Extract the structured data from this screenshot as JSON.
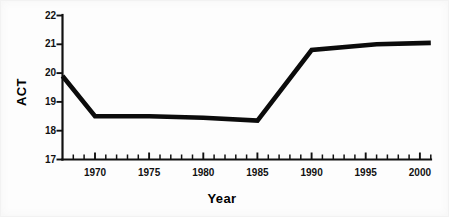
{
  "chart_data": {
    "type": "line",
    "title": "",
    "subtitle": "",
    "xlabel": "Year",
    "ylabel": "ACT",
    "xlim": [
      1967,
      2001
    ],
    "ylim": [
      17,
      22
    ],
    "grid": false,
    "legend": null,
    "x_ticks": [
      1970,
      1975,
      1980,
      1985,
      1990,
      1995,
      2000
    ],
    "x_tick_labels": [
      "1970",
      "1975",
      "1980",
      "1985",
      "1990",
      "1995",
      "2000"
    ],
    "x_minor_tick_step": 1,
    "y_ticks": [
      17,
      18,
      19,
      20,
      21,
      22
    ],
    "y_tick_labels": [
      "17",
      "18",
      "19",
      "20",
      "21",
      "22"
    ],
    "series": [
      {
        "name": "ACT",
        "color": "#0b0b0b",
        "x": [
          1967,
          1970,
          1975,
          1980,
          1985,
          1990,
          1996,
          2001
        ],
        "values": [
          19.9,
          18.5,
          18.5,
          18.45,
          18.35,
          20.8,
          21.0,
          21.05
        ]
      }
    ]
  },
  "axes": {
    "y_axis_title": "ACT",
    "x_axis_title": "Year"
  }
}
